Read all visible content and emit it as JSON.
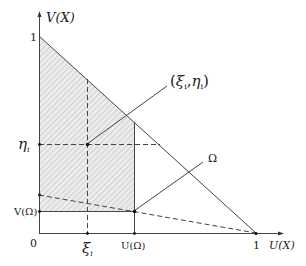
{
  "diagram": {
    "title": "",
    "axes": {
      "x_label": "U(X)",
      "y_label": "V(X)",
      "origin_label": "0",
      "x_max_label": "1",
      "y_max_label": "1"
    },
    "ticks": {
      "xi": "ξ",
      "xi_sub": "i",
      "u_omega": "U(Ω)",
      "eta": "η",
      "eta_sub": "i",
      "v_omega": "V(Ω)"
    },
    "annotations": {
      "point_label_open": "(",
      "point_xi": "ξ",
      "point_xi_sub": "i",
      "point_comma": ",",
      "point_eta": "η",
      "point_eta_sub": "i",
      "point_label_close": ")",
      "omega_label": "Ω"
    },
    "colors": {
      "line": "#444444",
      "hatch": "#bdbdbd",
      "fill": "#e9e9e9",
      "text": "#222222"
    }
  }
}
